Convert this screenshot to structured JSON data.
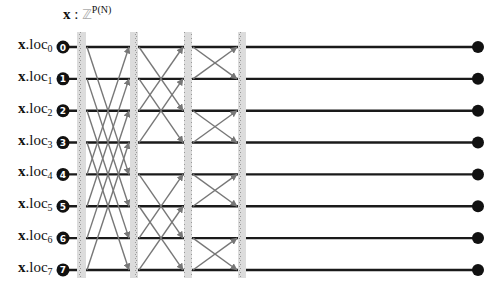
{
  "title": {
    "var": "x",
    "sep": " : ",
    "type_symbol": "ℤ",
    "superscript": "P(N)"
  },
  "locations": [
    {
      "var": "x",
      "field": ".loc",
      "index": "0",
      "node": "0"
    },
    {
      "var": "x",
      "field": ".loc",
      "index": "1",
      "node": "1"
    },
    {
      "var": "x",
      "field": ".loc",
      "index": "2",
      "node": "2"
    },
    {
      "var": "x",
      "field": ".loc",
      "index": "3",
      "node": "3"
    },
    {
      "var": "x",
      "field": ".loc",
      "index": "4",
      "node": "4"
    },
    {
      "var": "x",
      "field": ".loc",
      "index": "5",
      "node": "5"
    },
    {
      "var": "x",
      "field": ".loc",
      "index": "6",
      "node": "6"
    },
    {
      "var": "x",
      "field": ".loc",
      "index": "7",
      "node": "7"
    }
  ],
  "stages": [
    {
      "name": "stage-1",
      "span": 4
    },
    {
      "name": "stage-2",
      "span": 2
    },
    {
      "name": "stage-3",
      "span": 1
    }
  ],
  "colors": {
    "wire": "#1a1a1a",
    "cross": "#777777",
    "barrier_fill": "#dcdcdc",
    "barrier_dots": "#9a9a9a",
    "node": "#111111"
  }
}
